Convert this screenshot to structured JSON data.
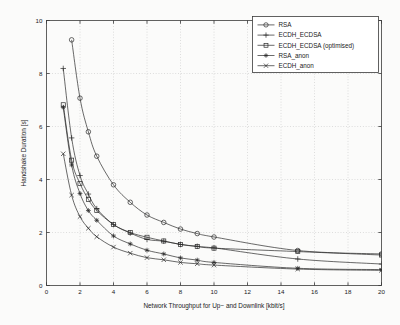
{
  "chart_data": {
    "type": "line",
    "title": "",
    "xlabel": "Network Throughput for Up− and Downlink [kbit/s]",
    "ylabel": "Handshake Duration [s]",
    "xlim": [
      0,
      20
    ],
    "ylim": [
      0,
      10
    ],
    "xticks": [
      0,
      2,
      4,
      6,
      8,
      10,
      12,
      14,
      16,
      18,
      20
    ],
    "yticks": [
      0,
      2,
      4,
      6,
      8,
      10
    ],
    "xtick_labels": [
      "0",
      "2",
      "4",
      "6",
      "8",
      "10",
      "12",
      "14",
      "16",
      "18",
      "20"
    ],
    "ytick_labels": [
      "0",
      "2",
      "4",
      "6",
      "8",
      "10"
    ],
    "grid": true,
    "grid_style": "dotted",
    "legend_position": "top-right",
    "x": [
      1,
      1.5,
      2,
      2.5,
      3,
      4,
      5,
      6,
      7,
      8,
      9,
      10,
      15,
      20
    ],
    "series": [
      {
        "name": "RSA",
        "marker": "circle",
        "values": [
          null,
          9.27,
          7.07,
          5.8,
          4.88,
          3.8,
          3.14,
          2.66,
          2.38,
          2.13,
          1.96,
          1.83,
          1.32,
          1.19
        ]
      },
      {
        "name": "ECDH_ECDSA",
        "marker": "plus",
        "values": [
          8.19,
          5.57,
          4.15,
          3.45,
          2.9,
          2.3,
          1.98,
          1.74,
          1.67,
          1.55,
          1.48,
          1.42,
          1.0,
          0.81
        ]
      },
      {
        "name": "ECDH_ECDSA (optimised)",
        "marker": "square",
        "values": [
          6.82,
          4.73,
          3.85,
          3.25,
          2.83,
          2.3,
          2.0,
          1.82,
          1.68,
          1.55,
          1.47,
          1.41,
          1.28,
          1.15
        ]
      },
      {
        "name": "RSA_anon",
        "marker": "asterisk",
        "values": [
          6.72,
          4.55,
          3.47,
          2.83,
          2.46,
          1.87,
          1.57,
          1.33,
          1.19,
          1.04,
          0.96,
          0.87,
          0.65,
          0.6
        ]
      },
      {
        "name": "ECDH_anon",
        "marker": "cross",
        "values": [
          4.97,
          3.41,
          2.6,
          2.16,
          1.84,
          1.45,
          1.22,
          1.05,
          0.97,
          0.87,
          0.82,
          0.77,
          0.62,
          0.57
        ]
      }
    ]
  },
  "legend": {
    "entries": [
      {
        "label": "RSA"
      },
      {
        "label": "ECDH_ECDSA"
      },
      {
        "label": "ECDH_ECDSA (optimised)"
      },
      {
        "label": "RSA_anon"
      },
      {
        "label": "ECDH_anon"
      }
    ]
  }
}
